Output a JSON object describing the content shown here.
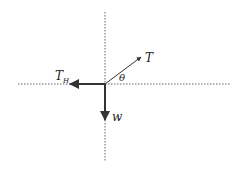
{
  "diagram": {
    "origin": [
      105,
      84
    ],
    "axes": {
      "horizontal": {
        "x1": 18,
        "x2": 231,
        "y": 84
      },
      "vertical": {
        "x": 105,
        "y1": 12,
        "y2": 162
      }
    },
    "vectors": [
      {
        "id": "T",
        "label": "T",
        "to": [
          141,
          57
        ],
        "label_pos": [
          146,
          62
        ],
        "color": "#333333",
        "width": 1
      },
      {
        "id": "TH",
        "label": "T",
        "subscript": "H",
        "to": [
          70,
          84
        ],
        "label_pos": [
          56,
          79
        ],
        "color": "#333333",
        "width": 2
      },
      {
        "id": "w",
        "label": "w",
        "to": [
          105,
          120
        ],
        "label_pos": [
          112,
          120
        ],
        "color": "#333333",
        "width": 2
      }
    ],
    "angle_label": {
      "text": "θ",
      "pos": [
        120,
        81
      ]
    },
    "colors": {
      "line": "#333333",
      "axis": "#666666",
      "background": "#ffffff"
    }
  }
}
